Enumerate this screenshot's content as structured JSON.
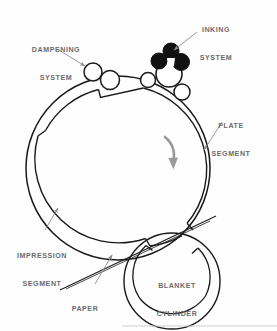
{
  "diagram": {
    "colors": {
      "ink_roller_fill": "#111111",
      "roller_outline": "#1a1a1a",
      "cylinder_outline": "#1a1a1a",
      "label_text": "#6b6b6e",
      "leader_line": "#8d8d90",
      "rotation_arrow": "#9a9a9d",
      "background": "#fefefe",
      "footer_rule": "#c9c9cc"
    },
    "labels": [
      {
        "id": "dampening",
        "line1": "DAMPENING",
        "line2": "SYSTEM"
      },
      {
        "id": "inking",
        "line1": "INKING",
        "line2": "SYSTEM"
      },
      {
        "id": "plate",
        "line1": "PLATE",
        "line2": "SEGMENT"
      },
      {
        "id": "impression",
        "line1": "IMPRESSION",
        "line2": "SEGMENT"
      },
      {
        "id": "paper",
        "line1": "PAPER",
        "line2": ""
      },
      {
        "id": "blanket",
        "line1": "BLANKET",
        "line2": "CYLINDER"
      }
    ],
    "components": {
      "plate_cylinder": {
        "name": "plate-impression-cylinder",
        "cx": 118,
        "cy": 168,
        "r_outer": 92,
        "r_inner": 84
      },
      "blanket_cylinder": {
        "name": "blanket-cylinder",
        "cx": 172,
        "cy": 281,
        "r_outer": 48,
        "r_inner": 41
      },
      "dampening_rollers": 2,
      "inking_rollers_white": 3,
      "inking_rollers_black": 3,
      "rotation_direction": "clockwise"
    }
  }
}
